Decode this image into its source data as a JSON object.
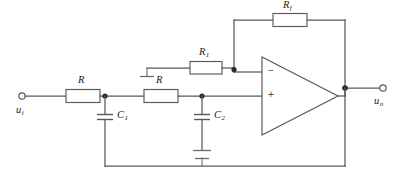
{
  "diagram": {
    "type": "circuit-schematic",
    "background_color": "#ffffff",
    "wire_color": "#595959",
    "label_color": "#1a1a1a"
  },
  "terminals": {
    "input": {
      "label_main": "u",
      "label_sub": "i",
      "symbol": "open-circle",
      "x": 22,
      "y": 96
    },
    "output": {
      "label_main": "u",
      "label_sub": "o",
      "symbol": "open-circle",
      "x": 383,
      "y": 88
    }
  },
  "components": [
    {
      "id": "R-first",
      "kind": "resistor",
      "label_main": "R",
      "label_sub": "",
      "orientation": "horizontal",
      "x": 62,
      "y": 96
    },
    {
      "id": "R-second",
      "kind": "resistor",
      "label_main": "R",
      "label_sub": "",
      "orientation": "horizontal",
      "x": 140,
      "y": 96
    },
    {
      "id": "C1",
      "kind": "capacitor",
      "label_main": "C",
      "label_sub": "1",
      "orientation": "vertical",
      "x": 105,
      "y": 120
    },
    {
      "id": "C2",
      "kind": "capacitor",
      "label_main": "C",
      "label_sub": "2",
      "orientation": "vertical",
      "x": 202,
      "y": 120
    },
    {
      "id": "R1",
      "kind": "resistor",
      "label_main": "R",
      "label_sub": "1",
      "orientation": "horizontal",
      "x": 196,
      "y": 68
    },
    {
      "id": "Rf",
      "kind": "resistor",
      "label_main": "R",
      "label_sub": "f",
      "orientation": "horizontal",
      "x": 290,
      "y": 26
    }
  ],
  "opamp": {
    "id": "opamp-U1",
    "shape": "triangle",
    "inverting_sign": "−",
    "noninverting_sign": "+",
    "inverting_input_y": 72,
    "noninverting_input_y": 96,
    "apex_x": 338,
    "base_x": 262
  },
  "grounds": [
    {
      "id": "ground-R1-left",
      "x": 145,
      "y": 72,
      "style": "bar"
    },
    {
      "id": "ground-bottom-rail",
      "x": 202,
      "y": 166,
      "style": "bar"
    },
    {
      "id": "ground-C2-bottom",
      "x": 202,
      "y": 150,
      "style": "bar"
    }
  ],
  "nodes": [
    {
      "id": "node-C1",
      "x": 105,
      "y": 96
    },
    {
      "id": "node-C2",
      "x": 202,
      "y": 96
    },
    {
      "id": "node-inverting",
      "x": 234,
      "y": 72
    },
    {
      "id": "node-output",
      "x": 345,
      "y": 88
    }
  ]
}
